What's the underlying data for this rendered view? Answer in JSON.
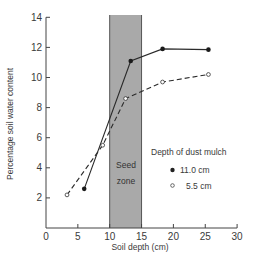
{
  "chart_data": {
    "type": "line",
    "title": "",
    "xlabel": "Soil depth (cm)",
    "ylabel": "Percentage soil water content",
    "xlim": [
      0,
      30
    ],
    "ylim": [
      0,
      14
    ],
    "xticks": [
      0,
      5,
      10,
      15,
      20,
      25,
      30
    ],
    "yticks": [
      2,
      4,
      6,
      8,
      10,
      12,
      14
    ],
    "grid": false,
    "legend": {
      "title": "Depth of dust mulch",
      "position": "right-middle",
      "entries": [
        {
          "label": "11.0 cm",
          "marker": "filled-circle",
          "line": "solid"
        },
        {
          "label": "5.5 cm",
          "marker": "open-circle",
          "line": "dashed"
        }
      ]
    },
    "annotations": [
      {
        "type": "shaded-band",
        "x_start": 10,
        "x_end": 15,
        "label": "Seed zone",
        "color": "#a9a9a9"
      }
    ],
    "series": [
      {
        "name": "11.0 cm",
        "style": "solid",
        "marker": "filled",
        "x": [
          6.0,
          13.3,
          18.3,
          25.5
        ],
        "y": [
          2.6,
          11.1,
          11.9,
          11.85
        ]
      },
      {
        "name": "5.5 cm",
        "style": "dashed",
        "marker": "open",
        "x": [
          3.3,
          8.9,
          12.5,
          18.3,
          25.5
        ],
        "y": [
          2.2,
          5.5,
          8.6,
          9.7,
          10.2
        ]
      }
    ]
  },
  "labels": {
    "seed_zone_line1": "Seed",
    "seed_zone_line2": "zone",
    "legend_title": "Depth of dust mulch",
    "legend_item_1": "11.0 cm",
    "legend_item_2": "5.5 cm",
    "xlabel": "Soil depth (cm)",
    "ylabel": "Percentage soil water content"
  }
}
